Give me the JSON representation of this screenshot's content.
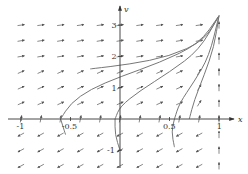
{
  "figure": {
    "type": "phase-portrait"
  },
  "axes": {
    "x_label": "x",
    "y_label": "v",
    "x_ticks": [
      {
        "value": -1,
        "label": "-1"
      },
      {
        "value": -0.5,
        "label": "-0.5"
      },
      {
        "value": 0.5,
        "label": "0.5"
      },
      {
        "value": 1,
        "label": "1"
      }
    ],
    "y_ticks": [
      {
        "value": 3,
        "label": "3"
      },
      {
        "value": 2,
        "label": "2"
      },
      {
        "value": 1,
        "label": "1"
      },
      {
        "value": -1,
        "label": "-1"
      }
    ],
    "x_range": [
      -1.2,
      1.25
    ],
    "y_range": [
      -1.7,
      3.6
    ]
  },
  "colors": {
    "axis": "#333333",
    "arrow": "#555555",
    "curve": "#777777",
    "background": "#ffffff"
  },
  "chart_data": {
    "type": "vector-field",
    "title": "",
    "xlabel": "x",
    "ylabel": "v",
    "xlim": [
      -1.2,
      1.25
    ],
    "ylim": [
      -1.7,
      3.6
    ],
    "grid": false,
    "field_grid": {
      "x": [
        -1.0,
        -0.8,
        -0.6,
        -0.4,
        -0.2,
        0.0,
        0.2,
        0.4,
        0.6,
        0.8,
        1.0
      ],
      "v": [
        -1.5,
        -1.0,
        -0.5,
        0.0,
        0.5,
        1.0,
        1.5,
        2.0,
        2.5,
        3.0
      ]
    },
    "solution_curves": [
      {
        "name": "curve-1",
        "points": [
          [
            -0.6,
            0.0
          ],
          [
            -0.5,
            0.5
          ],
          [
            -0.3,
            0.95
          ],
          [
            0.0,
            1.35
          ],
          [
            0.4,
            1.8
          ],
          [
            0.8,
            2.4
          ],
          [
            1.0,
            3.3
          ]
        ]
      },
      {
        "name": "curve-2",
        "points": [
          [
            -0.05,
            0.0
          ],
          [
            0.0,
            0.4
          ],
          [
            0.2,
            0.9
          ],
          [
            0.5,
            1.5
          ],
          [
            0.8,
            2.2
          ],
          [
            1.0,
            3.3
          ]
        ]
      },
      {
        "name": "curve-3",
        "points": [
          [
            0.55,
            0.0
          ],
          [
            0.6,
            0.5
          ],
          [
            0.75,
            1.2
          ],
          [
            0.9,
            2.0
          ],
          [
            1.0,
            3.3
          ]
        ]
      },
      {
        "name": "curve-4",
        "points": [
          [
            0.7,
            0.0
          ],
          [
            0.75,
            0.6
          ],
          [
            0.85,
            1.4
          ],
          [
            0.95,
            2.3
          ],
          [
            1.0,
            3.3
          ]
        ]
      },
      {
        "name": "curve-5",
        "points": [
          [
            -0.3,
            1.6
          ],
          [
            0.1,
            1.75
          ],
          [
            0.5,
            2.0
          ],
          [
            0.85,
            2.5
          ],
          [
            1.0,
            3.3
          ]
        ]
      },
      {
        "name": "curve-6",
        "points": [
          [
            0.0,
            -1.0
          ],
          [
            -0.05,
            -0.5
          ],
          [
            -0.05,
            0.0
          ]
        ]
      },
      {
        "name": "curve-7",
        "points": [
          [
            0.55,
            -0.9
          ],
          [
            0.52,
            -0.4
          ],
          [
            0.55,
            0.0
          ]
        ]
      },
      {
        "name": "curve-8",
        "points": [
          [
            -0.55,
            -0.5
          ],
          [
            -0.6,
            0.0
          ]
        ]
      }
    ],
    "fixed_point": {
      "x": 1.0,
      "v": 3.3
    }
  }
}
